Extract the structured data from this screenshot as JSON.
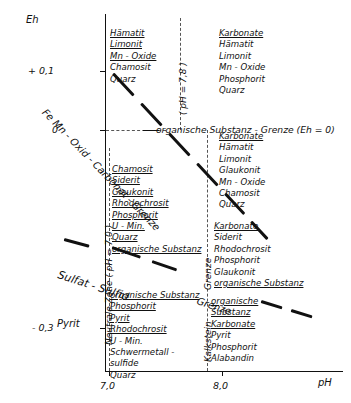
{
  "chart_data": {
    "type": "scatter",
    "title": "",
    "xlabel": "pH",
    "ylabel": "Eh",
    "xlim": [
      6.55,
      8.75
    ],
    "ylim": [
      -0.4,
      0.165
    ],
    "grid": false,
    "legend": "none",
    "x_ticks": [
      {
        "value": 7.0,
        "label": "7,0"
      },
      {
        "value": 8.0,
        "label": "8,0"
      }
    ],
    "y_ticks": [
      {
        "value": 0.1,
        "label": "+ 0,1"
      },
      {
        "value": 0.0,
        "label": "0"
      },
      {
        "value": -0.3,
        "label": "- 0,3"
      }
    ],
    "guide_lines": [
      {
        "name": "ph-70-line",
        "type": "vertical",
        "value": 7.0,
        "style": "dashed",
        "label": "Neutrale Zone ( pH = 7,0 )"
      },
      {
        "name": "ph-78-line",
        "type": "vertical",
        "value": 7.8,
        "style": "dashed",
        "label": "( pH = 7,8 )"
      },
      {
        "name": "kalkstein-line",
        "type": "vertical",
        "value": 7.85,
        "style": "dashed",
        "label": "Kalkstein Grenze"
      },
      {
        "name": "eh-zero-line",
        "type": "horizontal",
        "value": 0.0,
        "style": "dashed",
        "label": "organische Substanz - Grenze (Eh = 0)"
      }
    ],
    "boundaries": [
      {
        "name": "femn-oxid-carbonat-grenze",
        "label": "Fe Mn - Oxid - Carbonat - Grenze",
        "style": "thick-dashed"
      },
      {
        "name": "sulfat-sulfid-grenze",
        "label": "Sulfat - Sulfid - Grenze",
        "style": "thick-dashed"
      },
      {
        "name": "organische-substanz-grenze",
        "label": "organische Substanz - Grenze (Eh = 0)",
        "style": "thick-dashed"
      }
    ],
    "field_label": "Pyrit",
    "mineral_fields": [
      {
        "name": "field-top-left",
        "minerals": [
          {
            "text": "Hämatit",
            "underlined": true
          },
          {
            "text": "Limonit",
            "underlined": true
          },
          {
            "text": "Mn - Oxide",
            "underlined": true
          },
          {
            "text": "Chamosit",
            "underlined": false
          },
          {
            "text": "Quarz",
            "underlined": false
          }
        ]
      },
      {
        "name": "field-top-right",
        "minerals": [
          {
            "text": "Karbonate",
            "underlined": true
          },
          {
            "text": "Hämatit",
            "underlined": false
          },
          {
            "text": "Limonit",
            "underlined": false
          },
          {
            "text": "Mn - Oxide",
            "underlined": false
          },
          {
            "text": "Phosphorit",
            "underlined": false
          },
          {
            "text": "Quarz",
            "underlined": false
          }
        ]
      },
      {
        "name": "field-upper-mid-right",
        "minerals": [
          {
            "text": "Karbonate",
            "underlined": true
          },
          {
            "text": "Hämatit",
            "underlined": false
          },
          {
            "text": "Limonit",
            "underlined": false
          },
          {
            "text": "Glaukonit",
            "underlined": false
          },
          {
            "text": "Mn - Oxide",
            "underlined": false
          },
          {
            "text": "Chamosit",
            "underlined": false
          },
          {
            "text": "Quarz",
            "underlined": false
          }
        ]
      },
      {
        "name": "field-mid-left",
        "minerals": [
          {
            "text": "Chamosit",
            "underlined": true
          },
          {
            "text": "Siderit",
            "underlined": true
          },
          {
            "text": "Glaukonit",
            "underlined": true
          },
          {
            "text": "Rhodochrosit",
            "underlined": true
          },
          {
            "text": "Phosphorit",
            "underlined": true
          },
          {
            "text": "U - Min.",
            "underlined": true
          },
          {
            "text": "Quarz",
            "underlined": true
          },
          {
            "text": "organische Substanz",
            "underlined": true
          }
        ]
      },
      {
        "name": "field-mid-right",
        "minerals": [
          {
            "text": "Karbonate",
            "underlined": true
          },
          {
            "text": "Siderit",
            "underlined": false
          },
          {
            "text": "Rhodochrosit",
            "underlined": false
          },
          {
            "text": "Phosphorit",
            "underlined": false
          },
          {
            "text": "Glaukonit",
            "underlined": false
          },
          {
            "text": "organische Substanz",
            "underlined": true
          }
        ]
      },
      {
        "name": "field-bottom-left",
        "minerals": [
          {
            "text": "organische Substanz",
            "underlined": true
          },
          {
            "text": "Phosphorit",
            "underlined": true
          },
          {
            "text": "Pyrit",
            "underlined": true
          },
          {
            "text": "Rhodochrosit",
            "underlined": true
          },
          {
            "text": "U - Min.",
            "underlined": false
          },
          {
            "text": "Schwermetall -",
            "underlined": false
          },
          {
            "text": "sulfide",
            "underlined": false
          },
          {
            "text": "Quarz",
            "underlined": false
          }
        ]
      },
      {
        "name": "field-bottom-right",
        "minerals": [
          {
            "text": "organische",
            "underlined": true
          },
          {
            "text": "Substanz",
            "underlined": true
          },
          {
            "text": "Karbonate",
            "underlined": true
          },
          {
            "text": "Pyrit",
            "underlined": false
          },
          {
            "text": "Phosphorit",
            "underlined": false
          },
          {
            "text": "Alabandin",
            "underlined": false
          }
        ]
      }
    ]
  },
  "axes": {
    "y_title": "Eh",
    "x_title": "pH",
    "y_tick_plus01": "+ 0,1",
    "y_tick_0": "0",
    "y_tick_minus03": "- 0,3",
    "x_tick_70": "7,0",
    "x_tick_80": "8,0"
  },
  "labels": {
    "femn": "Fe Mn - Oxid - Carbonat - Grenze",
    "org_eh0": "organische Substanz - Grenze (Eh = 0)",
    "sulfat_sulfid": "Sulfat - Sulfid",
    "sulfat_grenze": "Grenze",
    "org_grenze_diag": "Grenze",
    "ph78": "( pH = 7,8 )",
    "neutrale_zone": "Neutrale Zone ( pH = 7,0 )",
    "kalkstein": "Kalkstein",
    "grenze_right": "Grenze",
    "pyrit": "Pyrit"
  }
}
